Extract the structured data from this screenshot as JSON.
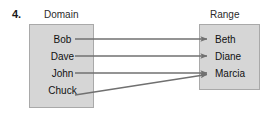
{
  "problem": {
    "number": "4."
  },
  "diagram": {
    "type": "mapping-diagram",
    "domain": {
      "caption": "Domain",
      "items": [
        "Bob",
        "Dave",
        "John",
        "Chuck"
      ]
    },
    "range": {
      "caption": "Range",
      "items": [
        "Beth",
        "Diane",
        "Marcia"
      ]
    },
    "mappings": [
      {
        "from": "Bob",
        "to": "Beth"
      },
      {
        "from": "Dave",
        "to": "Diane"
      },
      {
        "from": "John",
        "to": "Marcia"
      },
      {
        "from": "Chuck",
        "to": "Marcia"
      }
    ],
    "colors": {
      "box_fill": "#d6d6d6",
      "box_border": "#a9a9a9",
      "arrow": "#707070",
      "text": "#111111"
    }
  }
}
